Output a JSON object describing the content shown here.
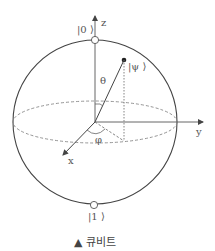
{
  "diagram": {
    "axes": {
      "z": "z",
      "y": "y",
      "x": "x"
    },
    "states": {
      "zero": "|0 ⟩",
      "one": "|1 ⟩",
      "psi": "|ψ ⟩"
    },
    "angles": {
      "theta": "θ",
      "phi": "φ"
    },
    "colors": {
      "stroke": "#444444",
      "dashed": "#888888",
      "text": "#555555"
    }
  },
  "caption": {
    "marker": "▲",
    "text": "큐비트"
  }
}
